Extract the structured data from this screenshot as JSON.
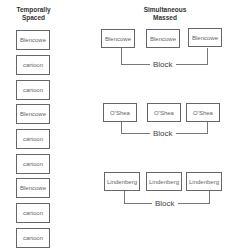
{
  "left": {
    "heading_line1": "Temporally",
    "heading_line2": "Spaced",
    "items": [
      "Blencowe",
      "cartoon",
      "cartoon",
      "Blencowe",
      "cartoon",
      "cartoon",
      "Blencowe",
      "cartoon",
      "cartoon"
    ]
  },
  "right": {
    "heading_line1": "Simultaneous",
    "heading_line2": "Massed",
    "groups": [
      {
        "items": [
          "Blencowe",
          "Blencowe",
          "Blencowe"
        ],
        "label": "Block"
      },
      {
        "items": [
          "O'Shea",
          "O'Shea",
          "O'Shea"
        ],
        "label": "Block"
      },
      {
        "items": [
          "Lindenberg",
          "Lindenberg",
          "Lindenberg"
        ],
        "label": "Block"
      }
    ]
  }
}
